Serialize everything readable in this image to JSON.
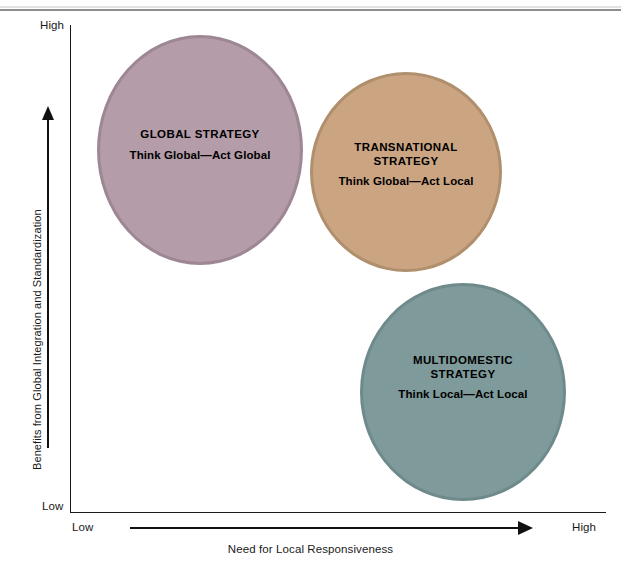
{
  "chart_data": {
    "type": "scatter",
    "title": "",
    "xlabel": "Need for Local Responsiveness",
    "ylabel": "Benefits from Global Integration and Standardization",
    "x_ticks": [
      "Low",
      "High"
    ],
    "y_ticks": [
      "Low",
      "High"
    ],
    "xlim": [
      "Low",
      "High"
    ],
    "ylim": [
      "Low",
      "High"
    ],
    "grid": false,
    "legend": "none",
    "bubbles": [
      {
        "id": "global",
        "title": "GLOBAL STRATEGY",
        "subtitle": "Think Global—Act Global",
        "x": "Low",
        "y": "High",
        "color": "#b49ca8",
        "border_color": "#9d8794"
      },
      {
        "id": "transnational",
        "title": "TRANSNATIONAL\nSTRATEGY",
        "subtitle": "Think Global—Act Local",
        "x": "High",
        "y": "High",
        "color": "#cba482",
        "border_color": "#b08f6d"
      },
      {
        "id": "multidomestic",
        "title": "MULTIDOMESTIC\nSTRATEGY",
        "subtitle": "Think Local—Act Local",
        "x": "High",
        "y": "Low",
        "color": "#7e9a9a",
        "border_color": "#6e8a8a"
      }
    ]
  },
  "axes": {
    "y_high_label": "High",
    "y_low_label": "Low",
    "x_low_label": "Low",
    "x_high_label": "High",
    "y_axis_title": "Benefits from Global Integration and Standardization",
    "x_axis_title": "Need for Local Responsiveness"
  },
  "colors": {
    "axis": "#1a1a1a",
    "text": "#000000",
    "background": "#ffffff",
    "rule": "#8e8e8e"
  }
}
